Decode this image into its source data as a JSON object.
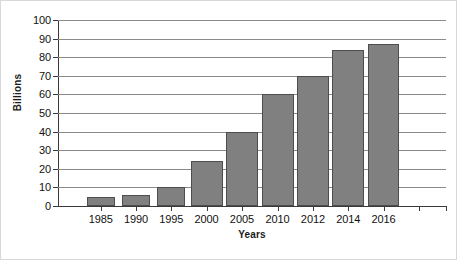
{
  "chart_data": {
    "type": "bar",
    "title": "",
    "xlabel": "Years",
    "ylabel": "Billions",
    "categories": [
      "1985",
      "1990",
      "1995",
      "2000",
      "2005",
      "2010",
      "2012",
      "2014",
      "2016"
    ],
    "values": [
      5,
      6,
      10,
      24,
      40,
      60,
      70,
      84,
      87
    ],
    "ylim": [
      0,
      100
    ],
    "ytick_labels": [
      "0",
      "10",
      "20",
      "30",
      "40",
      "50",
      "60",
      "70",
      "80",
      "90",
      "100"
    ],
    "ytick_values": [
      0,
      10,
      20,
      30,
      40,
      50,
      60,
      70,
      80,
      90,
      100
    ],
    "grid": true,
    "grid_axis": "y",
    "legend": false,
    "bar_color": "#808080",
    "bar_edge_color": "#4d4d4d",
    "grid_color": "#8a8a8a",
    "axis_color": "#3a3a3a",
    "background_color": "#ffffff",
    "extra_unlabeled_xticks": 2,
    "bars": [
      {
        "category": "1985",
        "value": 5,
        "center_pct": 11.0,
        "width_pct": 7.3
      },
      {
        "category": "1990",
        "value": 6,
        "center_pct": 20.1,
        "width_pct": 7.3
      },
      {
        "category": "1995",
        "value": 10,
        "center_pct": 29.2,
        "width_pct": 7.3
      },
      {
        "category": "2000",
        "value": 24,
        "center_pct": 38.3,
        "width_pct": 8.2
      },
      {
        "category": "2005",
        "value": 40,
        "center_pct": 47.4,
        "width_pct": 8.2
      },
      {
        "category": "2010",
        "value": 60,
        "center_pct": 56.6,
        "width_pct": 8.2
      },
      {
        "category": "2012",
        "value": 70,
        "center_pct": 65.7,
        "width_pct": 8.2
      },
      {
        "category": "2014",
        "value": 84,
        "center_pct": 74.8,
        "width_pct": 8.2
      },
      {
        "category": "2016",
        "value": 87,
        "center_pct": 83.9,
        "width_pct": 8.2
      }
    ],
    "xtick_positions_pct": [
      11.0,
      20.1,
      29.2,
      38.3,
      47.4,
      56.6,
      65.7,
      74.8,
      83.9,
      93.0,
      100.0
    ]
  }
}
